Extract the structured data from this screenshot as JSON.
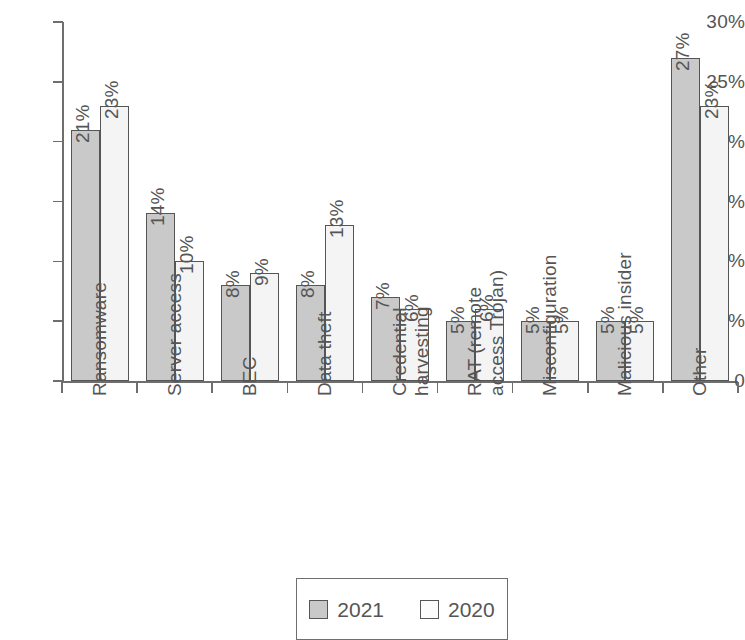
{
  "chart_data": {
    "type": "bar",
    "title": "",
    "subtitle": "",
    "xlabel": "",
    "ylabel": "",
    "ylim": [
      0,
      30
    ],
    "ytick_labels": [
      "30%",
      "25%",
      "20%",
      "15%",
      "10%",
      "5%",
      "0"
    ],
    "ytick_values": [
      30,
      25,
      20,
      15,
      10,
      5,
      0
    ],
    "grid": false,
    "legend_position": "bottom-center",
    "categories": [
      "Ransomware",
      "Server access",
      "BEC",
      "Data theft",
      "Credential harvesting",
      "RAT (remote access Trojan)",
      "Misconfiguration",
      "Malicious insider",
      "Other"
    ],
    "category_label_lines": [
      [
        "Ransomware"
      ],
      [
        "Server access"
      ],
      [
        "BEC"
      ],
      [
        "Data theft"
      ],
      [
        "Credential",
        "harvesting"
      ],
      [
        "RAT (remote",
        "access Trojan)"
      ],
      [
        "Misconfiguration"
      ],
      [
        "Malicious insider"
      ],
      [
        "Other"
      ]
    ],
    "series": [
      {
        "name": "2021",
        "color": "#c9c9c9",
        "values": [
          21,
          14,
          8,
          8,
          7,
          5,
          5,
          5,
          27
        ],
        "value_labels": [
          "21%",
          "14%",
          "8%",
          "8%",
          "7%",
          "5%",
          "5%",
          "5%",
          "27%"
        ]
      },
      {
        "name": "2020",
        "color": "#f4f4f4",
        "values": [
          23,
          10,
          9,
          13,
          6,
          6,
          5,
          5,
          23
        ],
        "value_labels": [
          "23%",
          "10%",
          "9%",
          "13%",
          "6%",
          "6%",
          "5%",
          "5%",
          "23%"
        ]
      }
    ]
  },
  "legend": {
    "entries": [
      {
        "label": "2021",
        "swatch": "gray-swatch"
      },
      {
        "label": "2020",
        "swatch": "white-swatch"
      }
    ]
  }
}
